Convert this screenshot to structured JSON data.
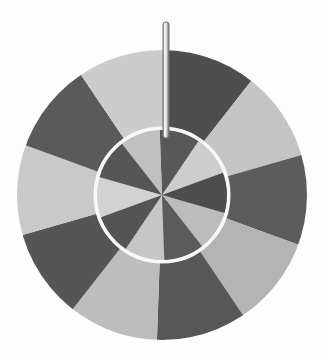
{
  "scene": {
    "title": "Spinning prize wheel",
    "background_color": "#fdfdfd",
    "width": 325,
    "height": 359
  },
  "wheel": {
    "name": "prize-wheel",
    "center_x": 162,
    "center_y": 195,
    "outer_radius": 145,
    "inner_radius": 67,
    "ring_color": "#f7f7f7",
    "ring_width": 4,
    "segment_count": 10,
    "segment_angle_deg": 36,
    "outer_start_angle_deg": -88,
    "inner_start_angle_deg": -92,
    "colors": {
      "dark": "#595959",
      "light": "#c2c2c2",
      "light_alt": "#cfcfcf",
      "dark_alt": "#4f4f4f"
    },
    "outer_segments": [
      {
        "index": 0,
        "label": "outer-segment-1",
        "tone": "dark",
        "color": "#4e4e4e"
      },
      {
        "index": 1,
        "label": "outer-segment-2",
        "tone": "light",
        "color": "#c4c4c4"
      },
      {
        "index": 2,
        "label": "outer-segment-3",
        "tone": "dark",
        "color": "#5c5c5c"
      },
      {
        "index": 3,
        "label": "outer-segment-4",
        "tone": "light",
        "color": "#b4b4b4"
      },
      {
        "index": 4,
        "label": "outer-segment-5",
        "tone": "dark",
        "color": "#575757"
      },
      {
        "index": 5,
        "label": "outer-segment-6",
        "tone": "light",
        "color": "#bdbdbd"
      },
      {
        "index": 6,
        "label": "outer-segment-7",
        "tone": "dark",
        "color": "#555555"
      },
      {
        "index": 7,
        "label": "outer-segment-8",
        "tone": "light",
        "color": "#c9c9c9"
      },
      {
        "index": 8,
        "label": "outer-segment-9",
        "tone": "dark",
        "color": "#5a5a5a"
      },
      {
        "index": 9,
        "label": "outer-segment-10",
        "tone": "light",
        "color": "#cccccc"
      }
    ],
    "inner_segments": [
      {
        "index": 0,
        "label": "inner-segment-1",
        "tone": "dark",
        "color": "#585858"
      },
      {
        "index": 1,
        "label": "inner-segment-2",
        "tone": "light",
        "color": "#cdcdcd"
      },
      {
        "index": 2,
        "label": "inner-segment-3",
        "tone": "dark",
        "color": "#4d4d4d"
      },
      {
        "index": 3,
        "label": "inner-segment-4",
        "tone": "light",
        "color": "#bcbcbc"
      },
      {
        "index": 4,
        "label": "inner-segment-5",
        "tone": "dark",
        "color": "#5b5b5b"
      },
      {
        "index": 5,
        "label": "inner-segment-6",
        "tone": "light",
        "color": "#c6c6c6"
      },
      {
        "index": 6,
        "label": "inner-segment-7",
        "tone": "dark",
        "color": "#545454"
      },
      {
        "index": 7,
        "label": "inner-segment-8",
        "tone": "light",
        "color": "#d2d2d2"
      },
      {
        "index": 8,
        "label": "inner-segment-9",
        "tone": "dark",
        "color": "#565656"
      },
      {
        "index": 9,
        "label": "inner-segment-10",
        "tone": "light",
        "color": "#c0c0c0"
      }
    ]
  },
  "pointer": {
    "name": "wheel-pointer",
    "x": 163,
    "y_top": 22,
    "y_bottom": 138,
    "width": 6,
    "fill_color": "#d8d8d8",
    "stroke_color": "#6f6f6f",
    "highlight_color": "#f2f2f2"
  }
}
